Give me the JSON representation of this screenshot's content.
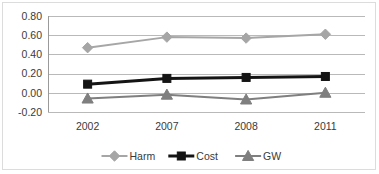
{
  "chart_data": {
    "type": "line",
    "title": "",
    "xlabel": "",
    "ylabel": "",
    "categories": [
      "2002",
      "2007",
      "2008",
      "2011"
    ],
    "ylim": [
      -0.2,
      0.8
    ],
    "ytick_labels": [
      "0.80",
      "0.60",
      "0.40",
      "0.20",
      "0.00",
      "-0.20"
    ],
    "ytick_values": [
      0.8,
      0.6,
      0.4,
      0.2,
      0.0,
      -0.2
    ],
    "grid": true,
    "legend_position": "bottom",
    "series": [
      {
        "name": "Harm",
        "values": [
          0.47,
          0.58,
          0.57,
          0.61
        ],
        "color": "#a6a6a6",
        "marker": "diamond",
        "line_width": 2
      },
      {
        "name": "Cost",
        "values": [
          0.09,
          0.15,
          0.16,
          0.17
        ],
        "color": "#141414",
        "marker": "square",
        "line_width": 3
      },
      {
        "name": "GW",
        "values": [
          -0.06,
          -0.02,
          -0.07,
          0.0
        ],
        "color": "#7f7f7f",
        "marker": "triangle",
        "line_width": 2
      }
    ]
  },
  "legend": {
    "items": [
      {
        "label": "Harm",
        "color": "#a6a6a6",
        "marker": "diamond"
      },
      {
        "label": "Cost",
        "color": "#141414",
        "marker": "square"
      },
      {
        "label": "GW",
        "color": "#7f7f7f",
        "marker": "triangle"
      }
    ]
  },
  "axis": {
    "y_labels": [
      "0.80",
      "0.60",
      "0.40",
      "0.20",
      "0.00",
      "-0.20"
    ],
    "x_labels": [
      "2002",
      "2007",
      "2008",
      "2011"
    ]
  }
}
